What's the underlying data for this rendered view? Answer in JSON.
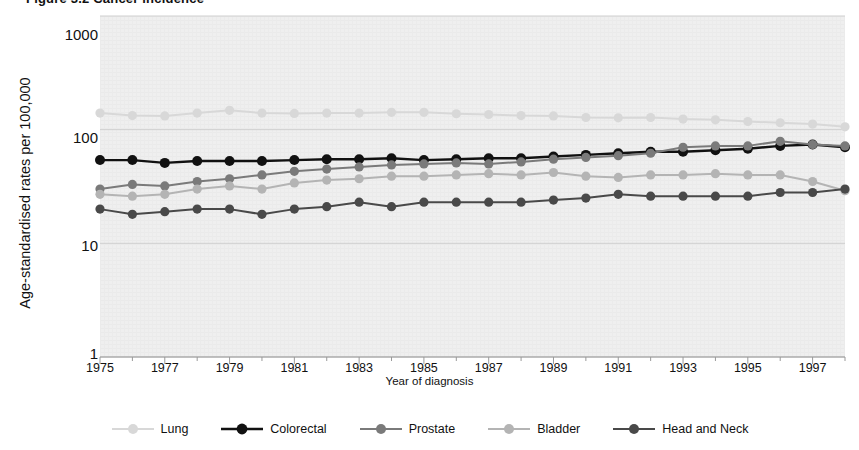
{
  "figure": {
    "title_partial": "Figure 3.2  Cancer incidence",
    "ylabel": "Age-standardised rates per 100,000",
    "xlabel": "Year of diagnosis"
  },
  "axes": {
    "y_ticks": [
      "1000",
      "100",
      "10",
      "1"
    ],
    "y_tick_values": [
      1000,
      100,
      10,
      1
    ],
    "x_ticks": [
      "1975",
      "1977",
      "1979",
      "1981",
      "1983",
      "1985",
      "1987",
      "1989",
      "1991",
      "1993",
      "1995",
      "1997"
    ],
    "x_tick_values": [
      1975,
      1977,
      1979,
      1981,
      1983,
      1985,
      1987,
      1989,
      1991,
      1993,
      1995,
      1997
    ]
  },
  "legend": {
    "items": [
      {
        "label": "Lung",
        "color": "#d8d8d8"
      },
      {
        "label": "Colorectal",
        "color": "#111111"
      },
      {
        "label": "Prostate",
        "color": "#7a7a7a"
      },
      {
        "label": "Bladder",
        "color": "#b4b4b4"
      },
      {
        "label": "Head and Neck",
        "color": "#494949"
      }
    ]
  },
  "colors": {
    "plot_background": "#efefef",
    "gridline": "#cfcfcf",
    "axis": "#9a9a9a",
    "text": "#111111"
  },
  "chart_data": {
    "type": "line",
    "title": "Figure 3.2  Cancer incidence",
    "xlabel": "Year of diagnosis",
    "ylabel": "Age-standardised rates per 100,000",
    "yscale": "log",
    "ylim": [
      1,
      1000
    ],
    "xlim": [
      1975,
      1998
    ],
    "grid": true,
    "legend_position": "bottom",
    "x": [
      1975,
      1976,
      1977,
      1978,
      1979,
      1980,
      1981,
      1982,
      1983,
      1984,
      1985,
      1986,
      1987,
      1988,
      1989,
      1990,
      1991,
      1992,
      1993,
      1994,
      1995,
      1996,
      1997,
      1998
    ],
    "series": [
      {
        "name": "Lung",
        "color": "#d8d8d8",
        "values": [
          140,
          133,
          132,
          140,
          148,
          140,
          139,
          140,
          140,
          142,
          142,
          138,
          136,
          133,
          132,
          128,
          127,
          128,
          124,
          122,
          118,
          115,
          112,
          106
        ]
      },
      {
        "name": "Colorectal",
        "color": "#111111",
        "values": [
          54,
          54,
          51,
          53,
          53,
          53,
          54,
          55,
          55,
          56,
          54,
          55,
          56,
          56,
          58,
          60,
          62,
          64,
          64,
          66,
          68,
          72,
          74,
          70
        ]
      },
      {
        "name": "Prostate",
        "color": "#7a7a7a",
        "values": [
          30,
          33,
          32,
          35,
          37,
          40,
          43,
          45,
          47,
          49,
          50,
          51,
          50,
          52,
          55,
          57,
          59,
          62,
          70,
          72,
          72,
          79,
          74,
          72
        ]
      },
      {
        "name": "Bladder",
        "color": "#b4b4b4",
        "values": [
          27,
          26,
          27,
          30,
          32,
          30,
          34,
          36,
          37,
          39,
          39,
          40,
          41,
          40,
          42,
          39,
          38,
          40,
          40,
          41,
          40,
          40,
          35,
          29
        ]
      },
      {
        "name": "Head and Neck",
        "color": "#494949",
        "values": [
          20,
          18,
          19,
          20,
          20,
          18,
          20,
          21,
          23,
          21,
          23,
          23,
          23,
          23,
          24,
          25,
          27,
          26,
          26,
          26,
          26,
          28,
          28,
          30
        ]
      }
    ]
  }
}
